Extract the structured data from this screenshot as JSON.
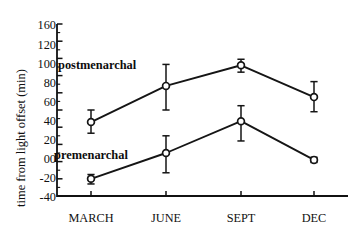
{
  "chart_data": {
    "type": "line",
    "title": "",
    "subtitle": "",
    "xlabel": "",
    "ylabel": "time from light offset (min)",
    "categories": [
      "MARCH",
      "JUNE",
      "SEPT",
      "DEC"
    ],
    "ylim": [
      -40,
      160
    ],
    "yticks": [
      -40,
      -20,
      0,
      20,
      40,
      60,
      80,
      100,
      120,
      160
    ],
    "ytick_labels": [
      "-40",
      "-20",
      "00",
      "20",
      "40",
      "60",
      "80",
      "100",
      "120",
      "160"
    ],
    "ytick_minor_step": 10,
    "grid": false,
    "legend_position": "inline-annotations",
    "marker": "open-circle",
    "errorbars": true,
    "series": [
      {
        "name": "postmenarchal",
        "values": [
          46,
          88,
          112,
          75
        ],
        "err_low": [
          13,
          28,
          8,
          17
        ],
        "err_high": [
          14,
          25,
          7,
          18
        ]
      },
      {
        "name": "premenarchal",
        "values": [
          -20,
          10,
          47,
          2
        ],
        "err_low": [
          6,
          23,
          23,
          3
        ],
        "err_high": [
          5,
          20,
          18,
          3
        ]
      }
    ],
    "annotations": [
      {
        "text": "postmenarchal",
        "x": 0.45,
        "y": 86
      },
      {
        "text": "premenarchal",
        "x": 0.4,
        "y": 8
      }
    ],
    "colors": {
      "axis": "#111111",
      "line": "#151515",
      "marker_fill": "#ffffff",
      "marker_stroke": "#151515",
      "text": "#111111",
      "background": "#ffffff"
    }
  }
}
